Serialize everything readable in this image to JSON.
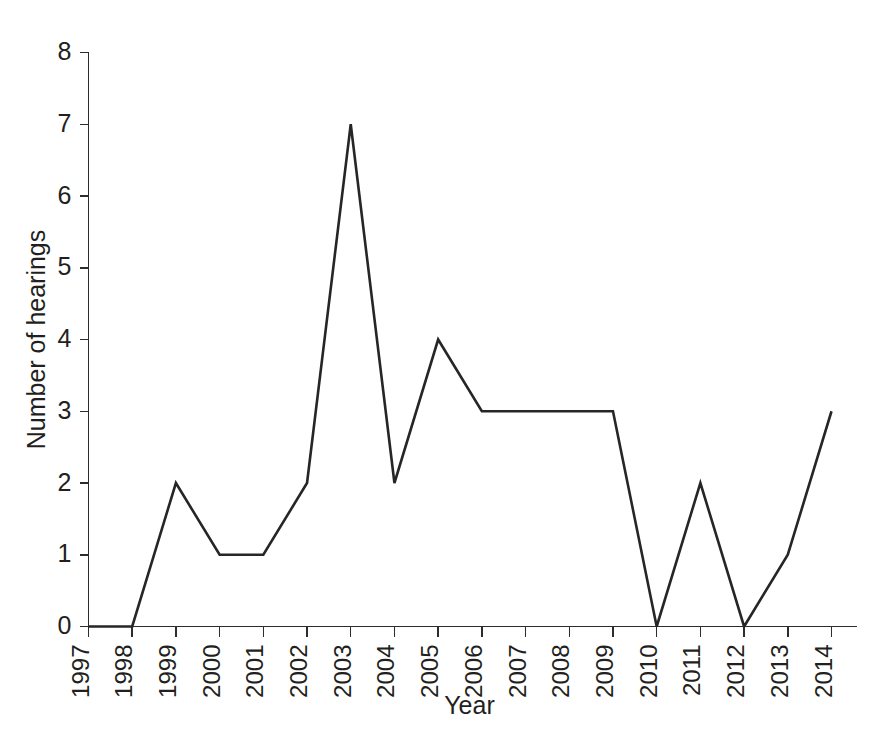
{
  "chart_data": {
    "type": "line",
    "title": "",
    "subtitle": "",
    "xlabel": "Year",
    "ylabel": "Number of hearings",
    "categories": [
      "1997",
      "1998",
      "1999",
      "2000",
      "2001",
      "2002",
      "2003",
      "2004",
      "2005",
      "2006",
      "2007",
      "2008",
      "2009",
      "2010",
      "2011",
      "2012",
      "2013",
      "2014"
    ],
    "values": [
      0,
      0,
      2,
      1,
      1,
      2,
      7,
      2,
      4,
      3,
      3,
      3,
      3,
      0,
      2,
      0,
      1,
      3
    ],
    "series": [
      {
        "name": "Number of hearings",
        "values": [
          0,
          0,
          2,
          1,
          1,
          2,
          7,
          2,
          4,
          3,
          3,
          3,
          3,
          0,
          2,
          0,
          1,
          3
        ]
      }
    ],
    "x_tick_labels": [
      "1997",
      "1998",
      "1999",
      "2000",
      "2001",
      "2002",
      "2003",
      "2004",
      "2005",
      "2006",
      "2007",
      "2008",
      "2009",
      "2010",
      "2011",
      "2012",
      "2013",
      "2014"
    ],
    "y_tick_labels": [
      "0",
      "1",
      "2",
      "3",
      "4",
      "5",
      "6",
      "7",
      "8"
    ],
    "y_ticks": [
      0,
      1,
      2,
      3,
      4,
      5,
      6,
      7,
      8
    ],
    "ylim": [
      0,
      8
    ],
    "xlim": [
      "1997",
      "2014"
    ],
    "grid": false,
    "legend": false,
    "legend_position": "none",
    "annotations": [],
    "line_color": "#262626",
    "background_color": "#ffffff",
    "axis_color": "#2c2c2c",
    "x_tick_rotation": 90
  }
}
